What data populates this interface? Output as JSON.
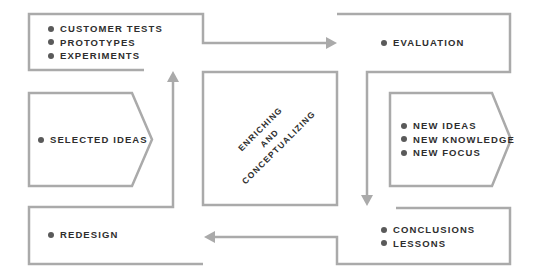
{
  "diagram": {
    "colors": {
      "line": "#aaaaaa",
      "text": "#2e2e2e",
      "bullet": "#5a5a5a"
    },
    "nodes": [
      {
        "id": "experiments",
        "items": [
          "CUSTOMER TESTS",
          "PROTOTYPES",
          "EXPERIMENTS"
        ]
      },
      {
        "id": "evaluation",
        "items": [
          "EVALUATION"
        ]
      },
      {
        "id": "selected-ideas",
        "items": [
          "SELECTED IDEAS"
        ]
      },
      {
        "id": "new-ideas",
        "items": [
          "NEW IDEAS",
          "NEW KNOWLEDGE",
          "NEW FOCUS"
        ]
      },
      {
        "id": "conclusions",
        "items": [
          "CONCLUSIONS",
          "LESSONS"
        ]
      },
      {
        "id": "redesign",
        "items": [
          "REDESIGN"
        ]
      }
    ],
    "center": {
      "lines": [
        "ENRICHING",
        "AND",
        "CONCEPTUALIZING"
      ]
    },
    "flow": [
      "experiments → evaluation",
      "evaluation → conclusions",
      "conclusions → redesign",
      "redesign → experiments"
    ]
  }
}
